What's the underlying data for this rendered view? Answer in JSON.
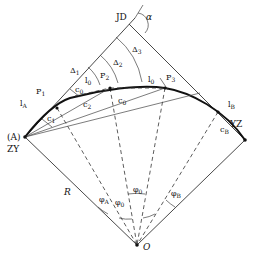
{
  "diagram": {
    "type": "curve-layout-geometry",
    "labels": {
      "jd": "JD",
      "alpha": "α",
      "zy": "ZY",
      "a_point": "(A)",
      "yz": "YZ",
      "o": "O",
      "r": "R",
      "lA": "l",
      "lA_sub": "A",
      "p1": "P",
      "p1_sub": "1",
      "p2": "P",
      "p2_sub": "2",
      "p3": "P",
      "p3_sub": "3",
      "delta1": "Δ",
      "delta1_sub": "1",
      "delta2": "Δ",
      "delta2_sub": "2",
      "delta3": "Δ",
      "delta3_sub": "3",
      "l0a": "l",
      "l0a_sub": "0",
      "l0b": "l",
      "l0b_sub": "0",
      "lB": "l",
      "lB_sub": "B",
      "c1": "c",
      "c1_sub": "1",
      "c2": "c",
      "c2_sub": "2",
      "c0a": "c",
      "c0a_sub": "0",
      "c0b": "c",
      "c0b_sub": "0",
      "cB": "c",
      "cB_sub": "B",
      "phiA": "φ",
      "phiA_sub": "A",
      "phi0a": "φ",
      "phi0a_sub": "0",
      "phi0b": "φ",
      "phi0b_sub": "0",
      "phiB": "φ",
      "phiB_sub": "B"
    }
  }
}
